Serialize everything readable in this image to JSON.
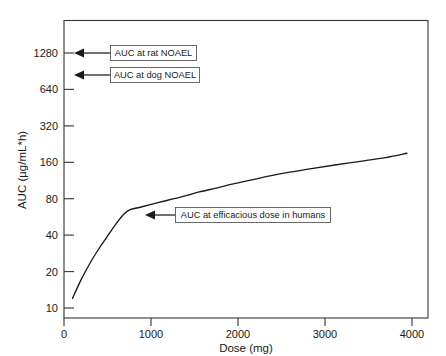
{
  "chart_data": {
    "type": "line",
    "title": "",
    "xlabel": "Dose (mg)",
    "ylabel": "AUC (µg/mL*h)",
    "xlim": [
      0,
      4300
    ],
    "ylim": [
      10,
      2560
    ],
    "yscale": "log2",
    "xscale": "linear",
    "grid": false,
    "legend": "none",
    "xticks": [
      0,
      1000,
      2000,
      3000,
      4000
    ],
    "xticklabels": [
      "0",
      "1000",
      "2000",
      "3000",
      "4000"
    ],
    "yticks": [
      10,
      20,
      40,
      80,
      160,
      320,
      640,
      1280
    ],
    "yticklabels": [
      "10",
      "20",
      "40",
      "80",
      "160",
      "320",
      "640",
      "1280"
    ],
    "series": [
      {
        "name": "AUC vs Dose",
        "x": [
          100,
          200,
          300,
          400,
          500,
          600,
          700,
          780,
          900,
          1100,
          1300,
          1500,
          1600,
          1800,
          2000,
          2300,
          2600,
          2900,
          3200,
          3500,
          3800,
          4050
        ],
        "y": [
          12,
          17,
          23,
          30,
          38,
          48,
          59,
          65,
          68,
          74,
          80,
          87,
          91,
          98,
          106,
          118,
          130,
          141,
          152,
          163,
          175,
          190
        ]
      }
    ],
    "annotations": [
      {
        "id": "rat-noael",
        "label": "AUC at rat NOAEL",
        "target_y": 1280,
        "target_x": 0,
        "arrow": "left"
      },
      {
        "id": "dog-noael",
        "label": "AUC at dog NOAEL",
        "target_y": 900,
        "target_x": 0,
        "arrow": "left"
      },
      {
        "id": "human-efficacious",
        "label": "AUC at efficacious dose in humans",
        "target_y": 57,
        "target_x": 900,
        "arrow": "left"
      }
    ]
  },
  "axes": {
    "x_title": "Dose (mg)",
    "y_title": "AUC (µg/mL*h)",
    "x_tick_labels": [
      "0",
      "1000",
      "2000",
      "3000",
      "4000"
    ],
    "y_tick_labels": [
      "1280",
      "640",
      "320",
      "160",
      "80",
      "40",
      "20",
      "10"
    ]
  },
  "annotations": {
    "rat_noael": "AUC at rat NOAEL",
    "dog_noael": "AUC at dog NOAEL",
    "human_efficacious": "AUC at efficacious dose in humans"
  },
  "colors": {
    "background": "#ffffff",
    "curve": "#1a1a1a",
    "frame": "#333333",
    "annotation_border": "#5a5a5a",
    "text": "#1a1a1a"
  }
}
